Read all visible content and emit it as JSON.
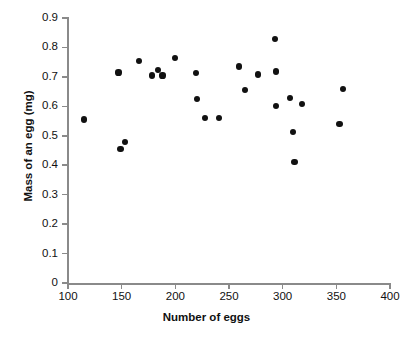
{
  "chart_data": {
    "type": "scatter",
    "title": "",
    "xlabel": "Number of eggs",
    "ylabel": "Mass of an egg (mg)",
    "xlim": [
      100,
      400
    ],
    "ylim": [
      0,
      0.9
    ],
    "xticks": [
      "100",
      "150",
      "200",
      "250",
      "300",
      "350",
      "400"
    ],
    "xtick_values": [
      100,
      150,
      200,
      250,
      300,
      350,
      400
    ],
    "yticks": [
      "0",
      "0.1",
      "0.2",
      "0.3",
      "0.4",
      "0.5",
      "0.6",
      "0.7",
      "0.8",
      "0.9"
    ],
    "ytick_values": [
      0,
      0.1,
      0.2,
      0.3,
      0.4,
      0.5,
      0.6,
      0.7,
      0.8,
      0.9
    ],
    "grid": false,
    "legend": false,
    "marker": "filled-circle",
    "marker_color": "#111111",
    "axis_color": "#8a8a8a",
    "background_color": "#ffffff",
    "series": [
      {
        "name": "eggs",
        "points": [
          [
            115,
            0.555
          ],
          [
            147,
            0.715
          ],
          [
            149,
            0.455
          ],
          [
            153,
            0.478
          ],
          [
            166,
            0.755
          ],
          [
            178,
            0.705
          ],
          [
            184,
            0.723
          ],
          [
            188,
            0.705
          ],
          [
            200,
            0.765
          ],
          [
            219,
            0.713
          ],
          [
            220,
            0.625
          ],
          [
            228,
            0.56
          ],
          [
            241,
            0.561
          ],
          [
            259,
            0.735
          ],
          [
            265,
            0.656
          ],
          [
            277,
            0.708
          ],
          [
            293,
            0.829
          ],
          [
            294,
            0.718
          ],
          [
            294,
            0.601
          ],
          [
            307,
            0.627
          ],
          [
            310,
            0.512
          ],
          [
            311,
            0.411
          ],
          [
            318,
            0.609
          ],
          [
            353,
            0.54
          ],
          [
            356,
            0.659
          ]
        ]
      }
    ]
  }
}
